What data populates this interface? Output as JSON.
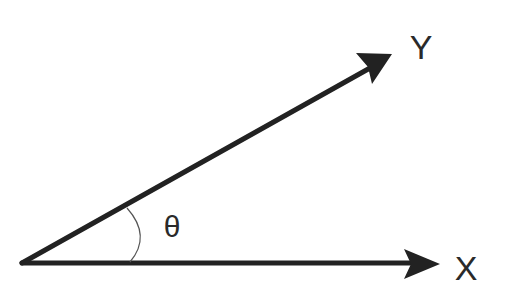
{
  "diagram": {
    "type": "angle-between-vectors",
    "vectors": [
      {
        "name": "vector-x",
        "label": "X"
      },
      {
        "name": "vector-y",
        "label": "Y"
      }
    ],
    "angle_label": "θ",
    "colors": {
      "stroke": "#222222",
      "arc": "#555555",
      "text": "#2a2a2a",
      "background": "#ffffff"
    }
  }
}
